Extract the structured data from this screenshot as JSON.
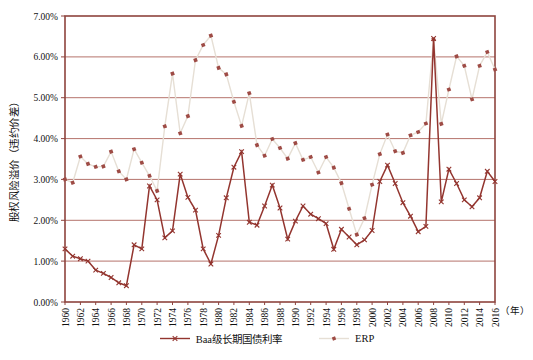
{
  "chart_data": {
    "type": "line",
    "title": "",
    "ylabel": "股权风险溢价（违约价差）",
    "xlabel": "（年）",
    "ylim": [
      0,
      7
    ],
    "yticks": [
      "0.00%",
      "1.00%",
      "2.00%",
      "3.00%",
      "4.00%",
      "5.00%",
      "6.00%",
      "7.00%"
    ],
    "xtick_step": 2,
    "grid": "horizontal",
    "legend_position": "bottom",
    "x": [
      1960,
      1961,
      1962,
      1963,
      1964,
      1965,
      1966,
      1967,
      1968,
      1969,
      1970,
      1971,
      1972,
      1973,
      1974,
      1975,
      1976,
      1977,
      1978,
      1979,
      1980,
      1981,
      1982,
      1983,
      1984,
      1985,
      1986,
      1987,
      1988,
      1989,
      1990,
      1991,
      1992,
      1993,
      1994,
      1995,
      1996,
      1997,
      1998,
      1999,
      2000,
      2001,
      2002,
      2003,
      2004,
      2005,
      2006,
      2007,
      2008,
      2009,
      2010,
      2011,
      2012,
      2013,
      2014,
      2015,
      2016
    ],
    "series": [
      {
        "name": "Baa级长期国债利率",
        "marker": "x",
        "line_color": "#93352F",
        "marker_color": "#93352F",
        "values": [
          1.3,
          1.12,
          1.06,
          1.0,
          0.78,
          0.7,
          0.6,
          0.47,
          0.4,
          1.4,
          1.3,
          2.84,
          2.5,
          1.57,
          1.74,
          3.13,
          2.56,
          2.25,
          1.3,
          0.93,
          1.63,
          2.55,
          3.3,
          3.68,
          1.95,
          1.88,
          2.35,
          2.86,
          2.3,
          1.54,
          1.98,
          2.35,
          2.15,
          2.04,
          1.92,
          1.29,
          1.78,
          1.59,
          1.4,
          1.52,
          1.75,
          2.95,
          3.35,
          2.9,
          2.43,
          2.1,
          1.72,
          1.85,
          6.45,
          2.45,
          3.25,
          2.9,
          2.5,
          2.33,
          2.55,
          3.2,
          2.95
        ]
      },
      {
        "name": "ERP",
        "marker": "tilted-square",
        "line_color": "#E6DFD5",
        "marker_color": "#9E4B45",
        "values": [
          3.0,
          2.92,
          3.56,
          3.38,
          3.31,
          3.32,
          3.68,
          3.2,
          3.0,
          3.74,
          3.41,
          3.09,
          2.72,
          4.3,
          5.59,
          4.13,
          4.55,
          5.92,
          6.29,
          6.52,
          5.73,
          5.57,
          4.9,
          4.31,
          5.11,
          3.84,
          3.58,
          3.99,
          3.77,
          3.51,
          3.89,
          3.48,
          3.55,
          3.17,
          3.55,
          3.29,
          2.91,
          2.28,
          1.65,
          2.05,
          2.87,
          3.62,
          4.1,
          3.69,
          3.65,
          4.08,
          4.16,
          4.37,
          6.43,
          4.36,
          5.2,
          6.01,
          5.78,
          4.96,
          5.78,
          6.12,
          5.69
        ]
      }
    ]
  },
  "colors": {
    "gridline": "#B5736C",
    "plot_border": "#8E443E",
    "text": "#111111",
    "background": "#FFFFFF"
  },
  "legend": {
    "items": [
      "Baa级长期国债利率",
      "ERP"
    ]
  }
}
